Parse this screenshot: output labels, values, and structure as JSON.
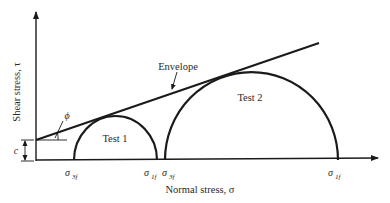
{
  "diagram": {
    "axes": {
      "x_label": "Normal stress, σ",
      "y_label": "Shear stress, τ"
    },
    "envelope": {
      "label": "Envelope",
      "angle_label": "ϕ",
      "intercept_label": "c"
    },
    "circles": [
      {
        "label": "Test 1",
        "sigma3_label": "σ",
        "sigma3_sub": "3f",
        "sigma1_label": "σ",
        "sigma1_sub": "1f"
      },
      {
        "label": "Test 2",
        "sigma3_label": "σ",
        "sigma3_sub": "3f",
        "sigma1_label": "σ",
        "sigma1_sub": "1f"
      }
    ],
    "colors": {
      "stroke": "#1a1a1a",
      "text": "#2a2a2a",
      "background": "#ffffff"
    }
  }
}
